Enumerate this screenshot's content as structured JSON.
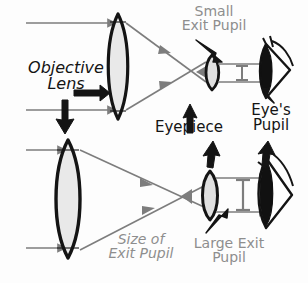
{
  "diagram": {
    "colors": {
      "stroke_black": "#141414",
      "ray_gray": "#7d7d7d",
      "label_gray": "#8e8e8e",
      "lens_fill": "#e9e9e9",
      "pupil_fill": "#111111",
      "background": "#fdfdfd"
    },
    "labels": {
      "small_exit_pupil": "Small\nExit Pupil",
      "objective_lens": "Objective\nLens",
      "eyepiece": "Eyepiece",
      "eyes_pupil": "Eye's\nPupil",
      "size_of_exit_pupil": "Size of\nExit Pupil",
      "large_exit_pupil": "Large Exit\nPupil"
    },
    "parts": {
      "objective_lens_top": "objective-lens-top",
      "objective_lens_bottom": "objective-lens-bottom",
      "eyepiece_top": "eyepiece-lens-top",
      "eyepiece_bottom": "eyepiece-lens-bottom",
      "eye_top": "eye-top",
      "eye_bottom": "eye-bottom",
      "exit_pupil_measure_top": "exit-pupil-measure-small",
      "exit_pupil_measure_bottom": "exit-pupil-measure-large"
    }
  }
}
